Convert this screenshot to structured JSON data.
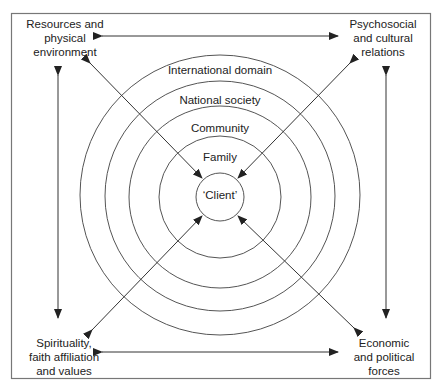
{
  "corners": {
    "top_left": [
      "Resources and",
      "physical",
      "environment"
    ],
    "top_right": [
      "Psychosocial",
      "and cultural",
      "relations"
    ],
    "bottom_left": [
      "Spirituality,",
      "faith affiliation",
      "and values"
    ],
    "bottom_right": [
      "Economic",
      "and political",
      "forces"
    ]
  },
  "rings": {
    "international": "International domain",
    "national": "National society",
    "community": "Community",
    "family": "Family",
    "client": "‘Client’"
  },
  "colors": {
    "line": "#333333",
    "circle": "#555555",
    "frame": "#666666"
  }
}
